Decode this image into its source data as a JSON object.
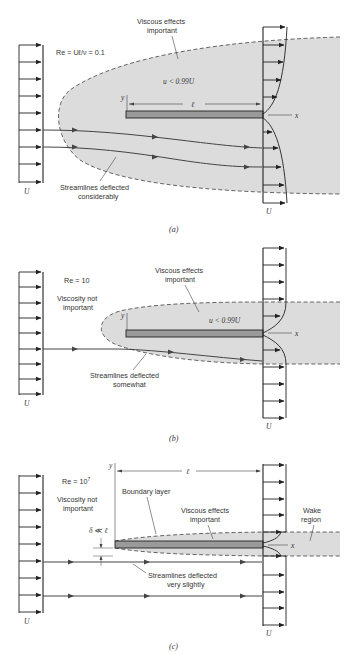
{
  "figure": {
    "type": "flow-past-flat-plate-reynolds-comparison",
    "colors": {
      "region_fill": "#dcdcdc",
      "plate_fill": "#9a9a9a",
      "line": "#222222",
      "dashed": "#555555",
      "text": "#333333"
    },
    "panels": [
      {
        "id": "a",
        "caption": "(a)",
        "reynolds": "Re = Uℓ/ν = 0.1",
        "viscous_label_line1": "Viscous effects",
        "viscous_label_line2": "important",
        "velocity_condition": "u < 0.99U",
        "length_label": "ℓ",
        "y_axis": "y",
        "x_axis": "x",
        "streamline_label_line1": "Streamlines deflected",
        "streamline_label_line2": "considerably",
        "upstream_velocity": "U",
        "downstream_velocity": "U"
      },
      {
        "id": "b",
        "caption": "(b)",
        "reynolds": "Re = 10",
        "inviscid_label_line1": "Viscosity not",
        "inviscid_label_line2": "important",
        "viscous_label_line1": "Viscous effects",
        "viscous_label_line2": "important",
        "velocity_condition": "u < 0.99U",
        "y_axis": "y",
        "x_axis": "x",
        "streamline_label_line1": "Streamlines deflected",
        "streamline_label_line2": "somewhat",
        "upstream_velocity": "U",
        "downstream_velocity": "U"
      },
      {
        "id": "c",
        "caption": "(c)",
        "reynolds_base": "Re = 10",
        "reynolds_exp": "7",
        "inviscid_label_line1": "Viscosity not",
        "inviscid_label_line2": "important",
        "boundary_layer_label": "Boundary layer",
        "viscous_label_line1": "Viscous effects",
        "viscous_label_line2": "important",
        "wake_label_line1": "Wake",
        "wake_label_line2": "region",
        "thickness_label": "δ ≪ ℓ",
        "length_label": "ℓ",
        "y_axis": "y",
        "x_axis": "x",
        "streamline_label_line1": "Streamlines deflected",
        "streamline_label_line2": "very slightly",
        "upstream_velocity": "U",
        "downstream_velocity": "U"
      }
    ]
  }
}
